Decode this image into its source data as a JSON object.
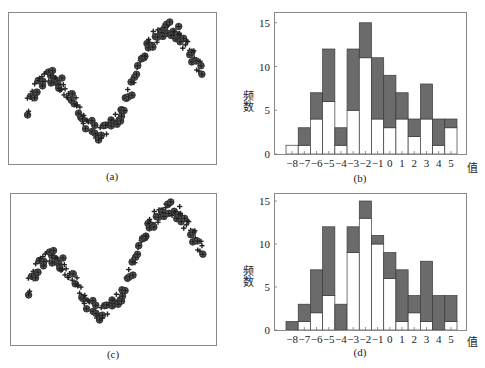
{
  "chart_data": [
    {
      "panel": "a",
      "type": "scatter",
      "caption": "(a)",
      "xlabel": "",
      "ylabel": "",
      "grid": false,
      "series": [
        {
          "name": "circle-plus markers",
          "marker": "circled-plus"
        },
        {
          "name": "plus markers",
          "marker": "plus"
        }
      ],
      "description": "Noisy sinusoid-plus-trend time series: falls from left, minimum ~30% across, rises through middle plateau, peaks near 85% across, then drops"
    },
    {
      "panel": "b",
      "type": "bar",
      "caption": "(b)",
      "xlabel": "值",
      "ylabel": "频数",
      "ylim": [
        0,
        16
      ],
      "yticks": [
        0,
        5,
        10,
        15
      ],
      "categories": [
        "-8",
        "-7",
        "-6",
        "-5",
        "-4",
        "-3",
        "-2",
        "-1",
        "0",
        "1",
        "2",
        "3",
        "4",
        "5"
      ],
      "series": [
        {
          "name": "white (lower)",
          "values": [
            1,
            1,
            4,
            6,
            1,
            5,
            11,
            4,
            3,
            4,
            2,
            4,
            1,
            3
          ]
        },
        {
          "name": "gray (upper top)",
          "values": [
            1,
            3,
            7,
            12,
            3,
            12,
            15,
            11,
            9,
            7,
            4,
            8,
            4,
            4
          ]
        }
      ]
    },
    {
      "panel": "c",
      "type": "scatter",
      "caption": "(c)",
      "xlabel": "",
      "ylabel": "",
      "grid": false,
      "series": [
        {
          "name": "circle-plus markers",
          "marker": "circled-plus"
        },
        {
          "name": "plus markers",
          "marker": "plus"
        }
      ],
      "description": "Same series as (a) with different marker assignment"
    },
    {
      "panel": "d",
      "type": "bar",
      "caption": "(d)",
      "xlabel": "值",
      "ylabel": "频数",
      "ylim": [
        0,
        16
      ],
      "yticks": [
        0,
        5,
        10,
        15
      ],
      "categories": [
        "-8",
        "-7",
        "-6",
        "-5",
        "-4",
        "-3",
        "-2",
        "-1",
        "0",
        "1",
        "2",
        "3",
        "4",
        "5"
      ],
      "series": [
        {
          "name": "white (lower)",
          "values": [
            0,
            1,
            2,
            4,
            0,
            9,
            13,
            10,
            6,
            1,
            2,
            1,
            0,
            1
          ]
        },
        {
          "name": "gray (upper top)",
          "values": [
            1,
            3,
            7,
            12,
            3,
            12,
            15,
            11,
            9,
            7,
            4,
            8,
            4,
            4
          ]
        }
      ]
    }
  ],
  "panels": {
    "a": {
      "caption": "(a)"
    },
    "b": {
      "caption": "(b)",
      "xlabel": "值",
      "ylabel": "频数"
    },
    "c": {
      "caption": "(c)"
    },
    "d": {
      "caption": "(d)",
      "xlabel": "值",
      "ylabel": "频数"
    }
  },
  "hist_ticks": {
    "y": [
      "0",
      "5",
      "10",
      "15"
    ],
    "x": [
      "−8",
      "−7",
      "−6",
      "−5",
      "−4",
      "−3",
      "−2",
      "−1",
      "0",
      "1",
      "2",
      "3",
      "4",
      "5"
    ]
  }
}
